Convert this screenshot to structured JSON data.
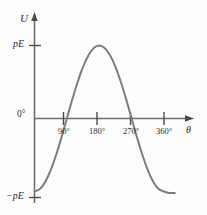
{
  "figure": {
    "background_color": "#fefefe",
    "curve_color": "#7c7c7c",
    "axis_color": "#6d6d6d",
    "text_color": "#2b2b2b"
  },
  "axes": {
    "y_axis_label": "U",
    "x_axis_label": "θ",
    "y_tick_top_label": "pE",
    "y_tick_bottom_label": "−pE",
    "origin_label": "0°"
  },
  "x_ticks": [
    {
      "label": "90°",
      "value": 90
    },
    {
      "label": "180°",
      "value": 180
    },
    {
      "label": "270°",
      "value": 270
    },
    {
      "label": "360°",
      "value": 360
    }
  ],
  "chart_data": {
    "type": "line",
    "title": "",
    "xlabel": "θ",
    "ylabel": "U",
    "grid": false,
    "legend": "none",
    "xlim": [
      0,
      400
    ],
    "ylim": [
      -1.12,
      1.12
    ],
    "xtick_labels": [
      "90°",
      "180°",
      "270°",
      "360°"
    ],
    "xtick_values": [
      90,
      180,
      270,
      360
    ],
    "ytick_labels": [
      "pE",
      "0°",
      "−pE"
    ],
    "ytick_values": [
      1,
      0,
      -1
    ],
    "annotations": [],
    "series": [
      {
        "name": "U = −pE cosθ",
        "x": [
          0,
          15,
          30,
          45,
          60,
          75,
          90,
          105,
          120,
          135,
          150,
          165,
          180,
          195,
          210,
          225,
          240,
          255,
          270,
          285,
          300,
          315,
          330,
          345,
          360,
          375,
          390
        ],
        "values": [
          -1.0,
          -0.966,
          -0.866,
          -0.707,
          -0.5,
          -0.259,
          0.0,
          0.259,
          0.5,
          0.707,
          0.866,
          0.966,
          1.0,
          0.966,
          0.866,
          0.707,
          0.5,
          0.259,
          0.0,
          -0.259,
          -0.5,
          -0.707,
          -0.866,
          -0.966,
          -1.0,
          -1.02,
          -1.02
        ]
      }
    ]
  }
}
